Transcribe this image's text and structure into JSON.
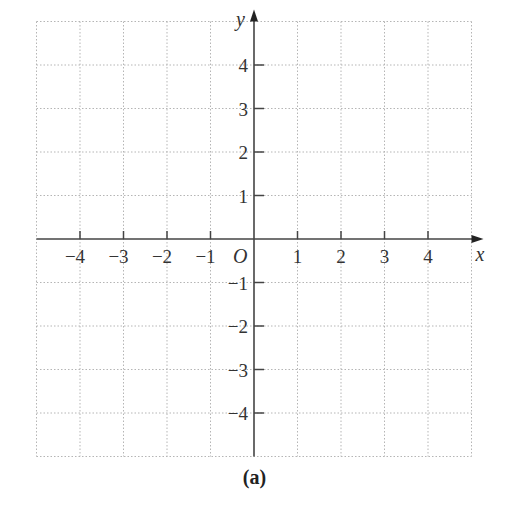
{
  "chart_data": {
    "type": "scatter",
    "title": "",
    "caption": "(a)",
    "xlabel": "x",
    "ylabel": "y",
    "origin_label": "O",
    "xlim": [
      -5,
      5
    ],
    "ylim": [
      -5,
      5
    ],
    "grid": true,
    "grid_style": "dotted",
    "x_ticks": [
      -4,
      -3,
      -2,
      -1,
      1,
      2,
      3,
      4
    ],
    "y_ticks": [
      -4,
      -3,
      -2,
      -1,
      1,
      2,
      3,
      4
    ],
    "x_tick_labels": [
      "−4",
      "−3",
      "−2",
      "−1",
      "1",
      "2",
      "3",
      "4"
    ],
    "y_tick_labels": [
      "−4",
      "−3",
      "−2",
      "−1",
      "1",
      "2",
      "3",
      "4"
    ],
    "series": [],
    "legend": null
  },
  "colors": {
    "axis": "#444444",
    "grid": "#b5b5b5",
    "text": "#333333",
    "background": "#ffffff"
  }
}
